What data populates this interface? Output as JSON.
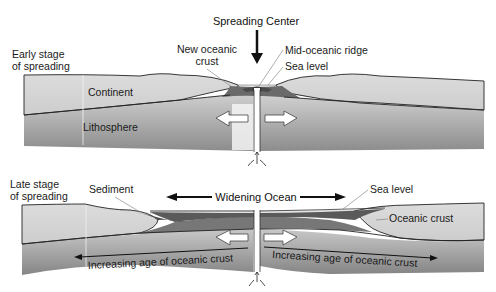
{
  "title": "Spreading Center",
  "early_panel": {
    "stage_label_line1": "Early stage",
    "stage_label_line2": "of spreading",
    "labels": {
      "new_oceanic_crust_line1": "New oceanic",
      "new_oceanic_crust_line2": "crust",
      "mid_oceanic_ridge": "Mid-oceanic ridge",
      "sea_level": "Sea level",
      "continent": "Continent",
      "lithosphere": "Lithosphere"
    }
  },
  "late_panel": {
    "stage_label_line1": "Late stage",
    "stage_label_line2": "of spreading",
    "labels": {
      "sediment": "Sediment",
      "widening_ocean": "Widening Ocean",
      "sea_level": "Sea level",
      "oceanic_crust": "Oceanic crust",
      "increasing_age_left": "Increasing age of oceanic crust",
      "increasing_age_right": "Increasing age of oceanic crust"
    }
  },
  "colors": {
    "continent": "#d4d4d4",
    "lithosphere_top": "#c8c8c8",
    "lithosphere_bottom": "#8a8a8a",
    "oceanic_crust": "#6e6e6e",
    "sediment": "#4a4a4a",
    "ocean_water": "#e2e2e2",
    "outline": "#222222"
  }
}
